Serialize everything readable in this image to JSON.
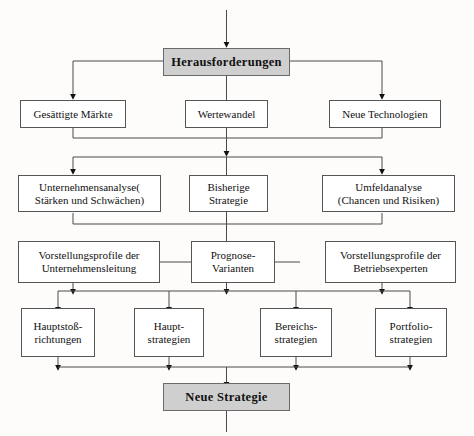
{
  "diagram": {
    "title_box": {
      "label": "Herausforderungen"
    },
    "result_box": {
      "label": "Neue Strategie"
    },
    "row_challenges": [
      {
        "label": "Gesättigte Märkte"
      },
      {
        "label": "Wertewandel"
      },
      {
        "label": "Neue Technologien"
      }
    ],
    "row_analysis": [
      {
        "label": "Unternehmensanalyse(\nStärken und Schwächen)"
      },
      {
        "label": "Bisherige\nStrategie"
      },
      {
        "label": "Umfeldanalyse\n(Chancen und Risiken)"
      }
    ],
    "row_profiles": [
      {
        "label": "Vorstellungsprofile der\nUnternehmensleitung"
      },
      {
        "label": "Prognose-\nVarianten"
      },
      {
        "label": "Vorstellungsprofile der\nBetriebsexperten"
      }
    ],
    "row_strategies": [
      {
        "label": "Hauptstoß-\nrichtungen"
      },
      {
        "label": "Haupt-\nstrategien"
      },
      {
        "label": "Bereichs-\nstrategien"
      },
      {
        "label": "Portfolio-\nstrategien"
      }
    ],
    "colors": {
      "shaded_fill": "#cfcfcf",
      "box_fill": "#ffffff",
      "border": "#555555",
      "connector": "#4a4a4a",
      "page_background": "#fdfcfa"
    }
  }
}
